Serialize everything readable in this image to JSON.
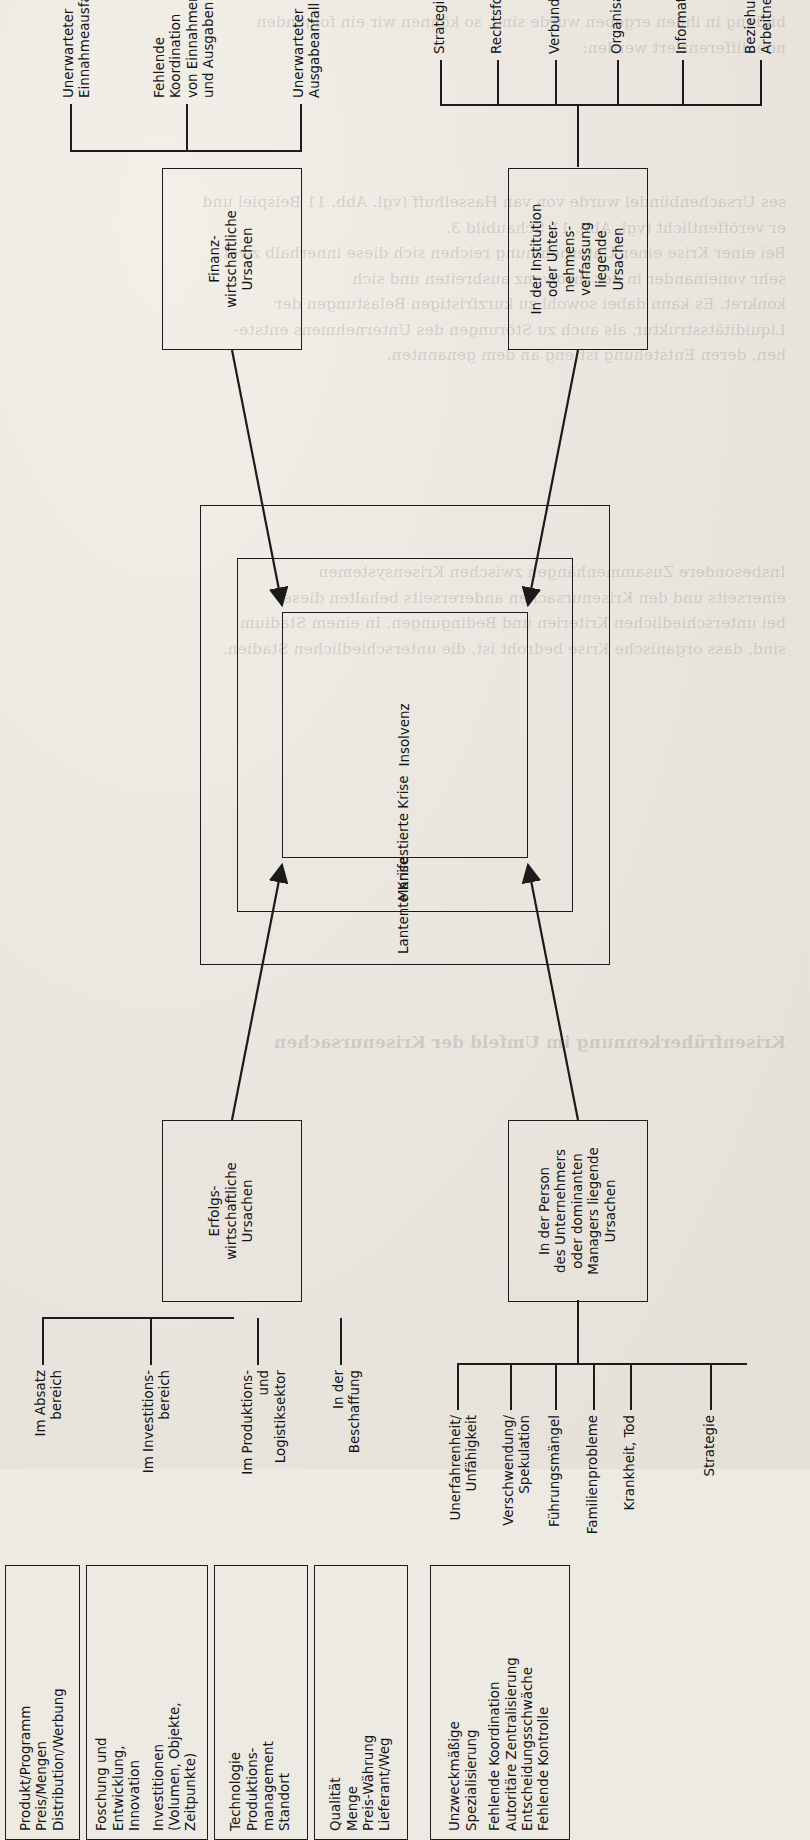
{
  "document": {
    "type": "textbook-figure",
    "language": "de",
    "page_background": "#ebe7e0",
    "ink_color": "#141414",
    "rotation": "figure rotated 90° counter-clockwise on the page"
  },
  "figure": {
    "core": {
      "outer_label": "Lantente Krise",
      "middle_label": "Manifestierte Krise",
      "inner_label": "Insolvenz"
    },
    "quadrants": [
      {
        "id": "erfolgswirtschaftliche",
        "lines": [
          "Erfolgs-",
          "wirtschaftliche",
          "Ursachen"
        ]
      },
      {
        "id": "finanzwirtschaftliche",
        "lines": [
          "Finanz-",
          "wirtschaftliche",
          "Ursachen"
        ]
      },
      {
        "id": "person",
        "lines": [
          "In der Person",
          "des Unternehmers",
          "oder dominanten",
          "Managers liegende",
          "Ursachen"
        ]
      },
      {
        "id": "institution",
        "lines": [
          "In der Institution",
          "oder Unter-",
          "nehmens-",
          "verfassung",
          "liegende",
          "Ursachen"
        ]
      }
    ],
    "erfolg_branches": [
      {
        "label": [
          "Im Absatz",
          "bereich"
        ],
        "items": [
          "Produkt/Programm",
          "Preis/Mengen",
          "Distribution/Werbung"
        ]
      },
      {
        "label": [
          "Im Investitions-",
          "bereich"
        ],
        "items": [
          "Foschung und",
          "Entwicklung,",
          "Innovation",
          "Investitionen",
          "(Volumen, Objekte,",
          "Zeitpunkte)"
        ]
      },
      {
        "label": [
          "Im Produktions-",
          "und",
          "Logistiksektor"
        ],
        "items": [
          "Technologie",
          "Produktions-",
          "management",
          "Standort"
        ]
      },
      {
        "label": [
          "In der",
          "Beschaffung"
        ],
        "items": [
          "Qualität",
          "Menge",
          "Preis-Währung",
          "Lieferant/Weg"
        ]
      }
    ],
    "finanz_branches": [
      {
        "label": [
          "Unerwarteter",
          "Einnahmeausfall"
        ],
        "items": [
          "Ausfall/Abwertung",
          "von Forderungen",
          "Zahlungsverzug",
          "der Kunden",
          "Rücknahme/Nicht-",
          "gewährung von Krediten",
          "Ausfall von Reserven"
        ]
      },
      {
        "label": [
          "Fehlende",
          "Koordination",
          "von Einnahmen",
          "und Ausgaben"
        ],
        "items": []
      },
      {
        "label": [
          "Unerwarteter",
          "Ausgabeanfall"
        ],
        "items": [
          "Kündigung von Krediten",
          "Vorverlegung von",
          "Zahlungszielen",
          "Nachzahlungen",
          "Aufwertung von",
          "Verbindlichkeiten"
        ]
      }
    ],
    "person_branches": [
      {
        "label": [
          "Unerfahrenheit/",
          "Unfähigkeit"
        ],
        "items": []
      },
      {
        "label": [
          "Verschwendung/",
          "Spekulation"
        ],
        "items": []
      },
      {
        "label": [
          "Führungsmängel"
        ],
        "items": []
      },
      {
        "label": [
          "Familienprobleme"
        ],
        "items": []
      },
      {
        "label": [
          "Krankheit, Tod"
        ],
        "items": []
      },
      {
        "label": [
          "Strategie"
        ],
        "items": [
          "Unzweckmäßige",
          "Spezialisierung",
          "Fehlende Koordination",
          "Autoritäre Zentralisierung",
          "Entscheidungsschwäche",
          "Fehlende Kontrolle"
        ]
      }
    ],
    "institution_branches": [
      {
        "label": [
          "Strategie"
        ],
        "items": [
          "Expansion/Offensive",
          "Abschöpfung/Defensive"
        ]
      },
      {
        "label": [
          "Rechtsform"
        ],
        "items": [
          "Steuerliche Nachteile",
          "Unklare Nachfolge"
        ]
      },
      {
        "label": [
          "Verbund"
        ],
        "items": [
          "Schwache Partner",
          "Wettbewerbs-",
          "beschränkung",
          "Autonomiestreben"
        ]
      },
      {
        "label": [
          "Organisation"
        ],
        "items": [
          "Über-/Unter-",
          "organisation",
          "Zu tiefe/flache",
          "Hierarchie"
        ]
      },
      {
        "label": [
          "Information"
        ],
        "items": [
          "Mängel im Planungs-",
          "und Kontrollsystem",
          "Ungenügende",
          "IuK-Technik"
        ]
      },
      {
        "label": [
          "Beziehungen zu den",
          "Arbeitnehmern"
        ],
        "items": [
          "Fehler im",
          "Personalmanagement",
          "Streik/Aussperrung",
          "Obstruktion/Sabotage"
        ]
      }
    ]
  },
  "ghost_text": {
    "block_top": "bildung in ihnen ergeben wurde sind, so können wir ein folgenden\nnde differenziert werden:",
    "block_a": "ses Ursachenbündel wurde von van Hasselhuff (vgl. Abb. 11 Beispiel und\ner veröffentlicht (vgl. Abb. 11 Schaubild 3.\nBei einer Krise einer Unternehmung reichen sich diese innerhalb zwei\nsehr voneinander in der Insolvenz ausbreiten und sich\nkonkret. Es kann dabei sowohl zu kurzfristigen Belastungen der\nLiquiditätsstruktur, als auch zu Störungen des Unternehmens entste-\nhen, deren Entstehung ist eng an dem genannten.",
    "block_b": "Insbesondere Zusammenhängen zwischen Krisensystemen\neinerseits und den Krisenursachen andererseits behalten diese\nbei unterschiedlichen Kriterien und Bedingungen. In einem Stadium\nsind, dass organische Krise bedroht ist, die unterschiedlichen Stadien.",
    "block_c": "Krisenfrüherkennung im Umfeld der Krisenursachen"
  }
}
